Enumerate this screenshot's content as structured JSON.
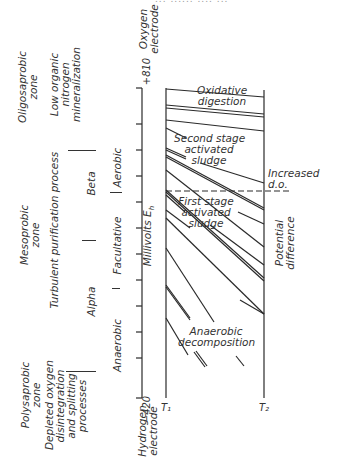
{
  "header_fragment": "... ...... .... ...",
  "axis": {
    "label": "Millivolts E",
    "label_subscript": "h",
    "top_value": "+810",
    "bottom_value": "−420",
    "top_electrode": [
      "Oxygen",
      "electrode"
    ],
    "bottom_electrode": [
      "Hydrogen",
      "electrode"
    ],
    "range": [
      -420,
      810
    ]
  },
  "columns": {
    "t1": "T₁",
    "t2": "T₂"
  },
  "zones": {
    "oligosaprobic": {
      "title": [
        "Oligosaprobic",
        "zone"
      ],
      "desc": [
        "Low organic",
        "nitrogen",
        "mineralization"
      ]
    },
    "mesoprobic": {
      "title": [
        "Mesoprobic",
        "zone"
      ],
      "desc": [
        "Turbulent purification process"
      ]
    },
    "polysaprobic": {
      "title": [
        "Polysaprobic",
        "zone"
      ],
      "desc": [
        "Depleted oxygen",
        "disintegration",
        "and splitting",
        "processes"
      ]
    }
  },
  "stages": {
    "beta": "Beta",
    "alpha": "Alpha",
    "aerobic": "Aerobic",
    "facultative": "Facultative",
    "anaerobic": "Anaerobic"
  },
  "regions": {
    "oxidative": [
      "Oxidative",
      "digestion"
    ],
    "second_stage": [
      "Second stage",
      "activated",
      "sludge"
    ],
    "first_stage": [
      "First stage",
      "activated",
      "sludge"
    ],
    "anaerobic": [
      "Anaerobic",
      "decomposition"
    ]
  },
  "annotations": {
    "increased_do": [
      "Increased",
      "d.o."
    ],
    "potential_difference": [
      "Potential",
      "difference"
    ]
  }
}
